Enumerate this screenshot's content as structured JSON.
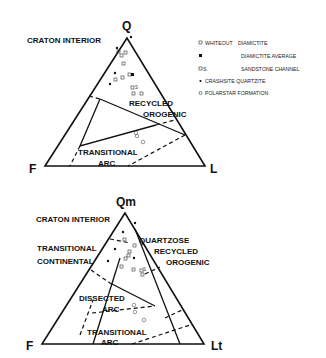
{
  "top_diagram": {
    "vertices": {
      "top": "Q",
      "left": "F",
      "right": "L"
    },
    "fields": {
      "craton_interior": "CRATON INTERIOR",
      "recycled_1": "RECYCLED",
      "recycled_2": "OROGENIC",
      "trans_arc_1": "TRANSITIONAL",
      "trans_arc_2": "ARC"
    }
  },
  "bottom_diagram": {
    "vertices": {
      "top": "Qm",
      "left": "F",
      "right": "Lt"
    },
    "fields": {
      "craton_interior": "CRATON INTERIOR",
      "trans_cont_1": "TRANSITIONAL",
      "trans_cont_2": "CONTINENTAL",
      "quartzose_1": "QUARTZOSE",
      "quartzose_2": "RECYCLED",
      "quartzose_3": "OROGENIC",
      "dissected_1": "DISSECTED",
      "dissected_2": "ARC",
      "trans_arc_1": "TRANSITIONAL",
      "trans_arc_2": "ARC"
    }
  },
  "legend": [
    {
      "marker": "open-square",
      "label_a": "WHITEOUT",
      "label_b": "DIAMICTITE"
    },
    {
      "marker": "filled-square",
      "label_a": "",
      "label_b": "DIAMICTITE AVERAGE"
    },
    {
      "marker": "open-square-s",
      "label_a": "S",
      "label_b": "SANDSTONE CHANNEL"
    },
    {
      "marker": "filled-dot",
      "label_a": "CRASHSITE QUARTZITE",
      "label_b": ""
    },
    {
      "marker": "open-circle",
      "label_a": "POLARSTAR FORMATION",
      "label_b": ""
    }
  ]
}
